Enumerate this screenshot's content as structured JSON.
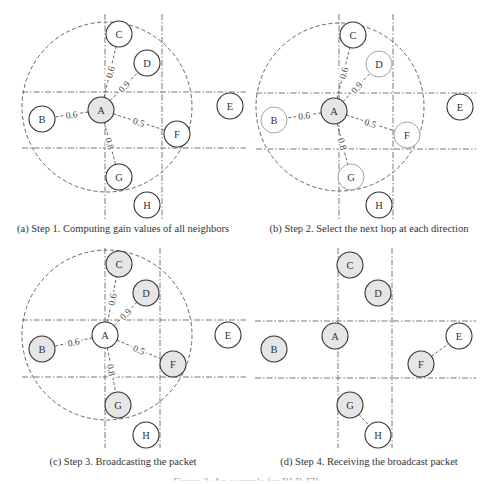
{
  "colors": {
    "node_fill_shaded": "#e6e6e6",
    "node_fill_plain": "#ffffff",
    "stroke_dark": "#333333",
    "stroke_light": "#9a9a9a",
    "line": "#555555"
  },
  "panels": [
    {
      "id": "a",
      "caption": "(a)  Step 1. Computing gain values of all neighbors",
      "caption_pos": [
        123,
        223
      ],
      "range_circle": {
        "cx": 107,
        "cy": 107,
        "r": 85
      },
      "grid": {
        "h": [
          92,
          148
        ],
        "v": [
          105,
          162
        ],
        "x_range": [
          22,
          246
        ],
        "y_range": [
          14,
          220
        ]
      },
      "nodes": [
        {
          "id": "A",
          "label": "A",
          "x": 101,
          "y": 110,
          "shaded": true,
          "stroke": "dark"
        },
        {
          "id": "B",
          "label": "B",
          "x": 42,
          "y": 119,
          "shaded": false,
          "stroke": "dark"
        },
        {
          "id": "C",
          "label": "C",
          "x": 119,
          "y": 34,
          "shaded": false,
          "stroke": "dark"
        },
        {
          "id": "D",
          "label": "D",
          "x": 147,
          "y": 63,
          "shaded": false,
          "stroke": "dark"
        },
        {
          "id": "E",
          "label": "E",
          "x": 230,
          "y": 106,
          "shaded": false,
          "stroke": "dark"
        },
        {
          "id": "F",
          "label": "F",
          "x": 177,
          "y": 134,
          "shaded": false,
          "stroke": "dark"
        },
        {
          "id": "G",
          "label": "G",
          "x": 119,
          "y": 177,
          "shaded": false,
          "stroke": "dark"
        },
        {
          "id": "H",
          "label": "H",
          "x": 147,
          "y": 205,
          "shaded": false,
          "stroke": "dark"
        }
      ],
      "edges": [
        {
          "from": "A",
          "to": "B",
          "label": "0.6"
        },
        {
          "from": "A",
          "to": "C",
          "label": "0.6"
        },
        {
          "from": "A",
          "to": "D",
          "label": "0.9"
        },
        {
          "from": "A",
          "to": "F",
          "label": "0.5"
        },
        {
          "from": "A",
          "to": "G",
          "label": "0.8"
        }
      ]
    },
    {
      "id": "b",
      "caption": "(b)  Step 2. Select the next hop at each direction",
      "caption_pos": [
        369,
        223
      ],
      "range_circle": {
        "cx": 340,
        "cy": 107,
        "r": 84
      },
      "grid": {
        "h": [
          93,
          149
        ],
        "v": [
          339,
          393
        ],
        "x_range": [
          256,
          476
        ],
        "y_range": [
          14,
          220
        ]
      },
      "nodes": [
        {
          "id": "A",
          "label": "A",
          "x": 334,
          "y": 111,
          "shaded": true,
          "stroke": "dark"
        },
        {
          "id": "B",
          "label": "B",
          "x": 274,
          "y": 120,
          "shaded": false,
          "stroke": "light"
        },
        {
          "id": "C",
          "label": "C",
          "x": 353,
          "y": 35,
          "shaded": false,
          "stroke": "dark"
        },
        {
          "id": "D",
          "label": "D",
          "x": 379,
          "y": 64,
          "shaded": false,
          "stroke": "light"
        },
        {
          "id": "E",
          "label": "E",
          "x": 460,
          "y": 107,
          "shaded": false,
          "stroke": "dark"
        },
        {
          "id": "F",
          "label": "F",
          "x": 407,
          "y": 135,
          "shaded": false,
          "stroke": "light"
        },
        {
          "id": "G",
          "label": "G",
          "x": 351,
          "y": 177,
          "shaded": false,
          "stroke": "light"
        },
        {
          "id": "H",
          "label": "H",
          "x": 379,
          "y": 205,
          "shaded": false,
          "stroke": "dark"
        }
      ],
      "edges": [
        {
          "from": "A",
          "to": "B",
          "label": "0.6"
        },
        {
          "from": "A",
          "to": "C",
          "label": "0.6"
        },
        {
          "from": "A",
          "to": "D",
          "label": "0.9"
        },
        {
          "from": "A",
          "to": "F",
          "label": "0.5"
        },
        {
          "from": "A",
          "to": "G",
          "label": "0.8"
        }
      ]
    },
    {
      "id": "c",
      "caption": "(c)  Step 3. Broadcasting the packet",
      "caption_pos": [
        123,
        456
      ],
      "range_circle": {
        "cx": 107,
        "cy": 335,
        "r": 85
      },
      "grid": {
        "h": [
          320,
          377
        ],
        "v": [
          105,
          160
        ],
        "x_range": [
          22,
          246
        ],
        "y_range": [
          248,
          448
        ]
      },
      "nodes": [
        {
          "id": "A",
          "label": "A",
          "x": 105,
          "y": 335,
          "shaded": false,
          "stroke": "dark"
        },
        {
          "id": "B",
          "label": "B",
          "x": 42,
          "y": 349,
          "shaded": true,
          "stroke": "dark"
        },
        {
          "id": "C",
          "label": "C",
          "x": 119,
          "y": 264,
          "shaded": true,
          "stroke": "dark"
        },
        {
          "id": "D",
          "label": "D",
          "x": 146,
          "y": 293,
          "shaded": true,
          "stroke": "dark"
        },
        {
          "id": "E",
          "label": "E",
          "x": 228,
          "y": 335,
          "shaded": false,
          "stroke": "dark"
        },
        {
          "id": "F",
          "label": "F",
          "x": 173,
          "y": 364,
          "shaded": true,
          "stroke": "dark"
        },
        {
          "id": "G",
          "label": "G",
          "x": 118,
          "y": 405,
          "shaded": true,
          "stroke": "dark"
        },
        {
          "id": "H",
          "label": "H",
          "x": 146,
          "y": 435,
          "shaded": false,
          "stroke": "dark"
        }
      ],
      "edges": [
        {
          "from": "A",
          "to": "B",
          "label": "0.6"
        },
        {
          "from": "A",
          "to": "C",
          "label": "0.6"
        },
        {
          "from": "A",
          "to": "D",
          "label": "0.9"
        },
        {
          "from": "A",
          "to": "F",
          "label": "0.5"
        },
        {
          "from": "A",
          "to": "G",
          "label": "0.8"
        }
      ]
    },
    {
      "id": "d",
      "caption": "(d)  Step 4. Receiving the broadcast packet",
      "caption_pos": [
        369,
        456
      ],
      "range_circle": null,
      "grid": {
        "h": [
          321,
          378
        ],
        "v": [
          338,
          392
        ],
        "x_range": [
          255,
          476
        ],
        "y_range": [
          248,
          448
        ]
      },
      "nodes": [
        {
          "id": "A",
          "label": "A",
          "x": 335,
          "y": 336,
          "shaded": true,
          "stroke": "dark"
        },
        {
          "id": "B",
          "label": "B",
          "x": 274,
          "y": 349,
          "shaded": true,
          "stroke": "dark"
        },
        {
          "id": "C",
          "label": "C",
          "x": 350,
          "y": 265,
          "shaded": true,
          "stroke": "dark"
        },
        {
          "id": "D",
          "label": "D",
          "x": 378,
          "y": 293,
          "shaded": true,
          "stroke": "dark"
        },
        {
          "id": "E",
          "label": "E",
          "x": 459,
          "y": 336,
          "shaded": false,
          "stroke": "dark"
        },
        {
          "id": "F",
          "label": "F",
          "x": 421,
          "y": 364,
          "shaded": true,
          "stroke": "dark"
        },
        {
          "id": "G",
          "label": "G",
          "x": 350,
          "y": 405,
          "shaded": true,
          "stroke": "dark"
        },
        {
          "id": "H",
          "label": "H",
          "x": 378,
          "y": 435,
          "shaded": false,
          "stroke": "dark"
        }
      ],
      "edges": [
        {
          "from": "F",
          "to": "E",
          "label": ""
        },
        {
          "from": "G",
          "to": "H",
          "label": ""
        }
      ]
    }
  ],
  "node_radius": 13,
  "figure_caption": "Figure 3: An example for BLR-FB"
}
